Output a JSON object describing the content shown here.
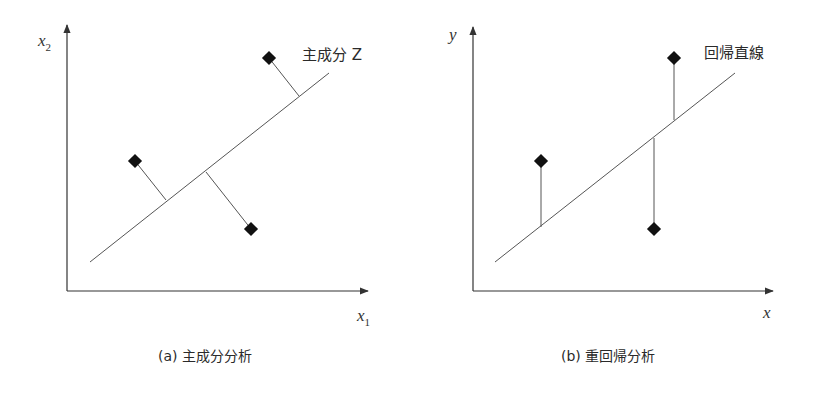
{
  "panels": [
    {
      "id": "a",
      "caption": "(a) 主成分分析",
      "y_axis_label": "x",
      "y_axis_sub": "2",
      "x_axis_label": "x",
      "x_axis_sub": "1",
      "line_label": "主成分 Z",
      "projection": "perpendicular",
      "points": [
        {
          "x": 269,
          "y": 58,
          "fx": 299,
          "fy": 96
        },
        {
          "x": 135,
          "y": 161,
          "fx": 166,
          "fy": 200
        },
        {
          "x": 251,
          "y": 229,
          "fx": 206,
          "fy": 172
        }
      ]
    },
    {
      "id": "b",
      "caption": "(b) 重回帰分析",
      "y_axis_label": "y",
      "x_axis_label": "x",
      "line_label": "回帰直線",
      "projection": "vertical",
      "points": [
        {
          "x": 674,
          "y": 58,
          "fx": 674,
          "fy": 120
        },
        {
          "x": 541,
          "y": 161,
          "fx": 541,
          "fy": 227
        },
        {
          "x": 654,
          "y": 229,
          "fx": 654,
          "fy": 138
        }
      ]
    }
  ],
  "colors": {
    "axis": "#333333",
    "line": "#555555",
    "marker": "#111111"
  }
}
